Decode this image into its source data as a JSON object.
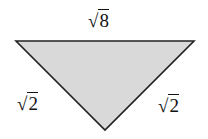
{
  "diagram": {
    "type": "triangle",
    "fill_color": "#d9d9d9",
    "stroke_color": "#222222",
    "vertices": {
      "top_left": [
        16,
        41
      ],
      "top_right": [
        194,
        41
      ],
      "bottom": [
        105,
        130
      ]
    },
    "labels": {
      "top": {
        "radical": "√",
        "radicand": "8"
      },
      "left": {
        "radical": "√",
        "radicand": "2"
      },
      "right": {
        "radical": "√",
        "radicand": "2"
      }
    }
  }
}
